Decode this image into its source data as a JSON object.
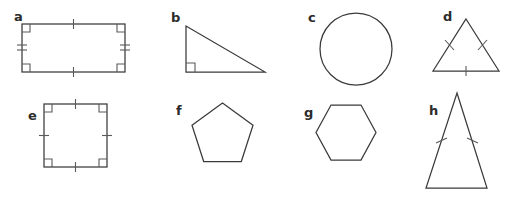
{
  "figure": {
    "background_color": "#ffffff",
    "stroke_color": "#3a3a3a",
    "mark_color": "#5a5a5a",
    "width": 513,
    "height": 205
  },
  "shapes": [
    {
      "label": "a",
      "name": "rectangle",
      "row": 1,
      "column": 1,
      "side_marks": "one tick on top and bottom, two ticks on left and right",
      "angle_marks": "right angle square at all four corners"
    },
    {
      "label": "b",
      "name": "right-triangle",
      "row": 1,
      "column": 2,
      "side_marks": "none",
      "angle_marks": "right angle square at bottom left vertex"
    },
    {
      "label": "c",
      "name": "circle",
      "row": 1,
      "column": 3,
      "side_marks": "none",
      "angle_marks": "none"
    },
    {
      "label": "d",
      "name": "isosceles-triangle",
      "row": 1,
      "column": 4,
      "side_marks": "one tick on each slanted side and one tick on the base",
      "angle_marks": "none"
    },
    {
      "label": "e",
      "name": "square",
      "row": 2,
      "column": 1,
      "side_marks": "one tick on all four sides",
      "angle_marks": "right angle square at all four corners"
    },
    {
      "label": "f",
      "name": "pentagon",
      "row": 2,
      "column": 2,
      "side_marks": "none",
      "angle_marks": "none"
    },
    {
      "label": "g",
      "name": "hexagon",
      "row": 2,
      "column": 3,
      "side_marks": "none",
      "angle_marks": "none"
    },
    {
      "label": "h",
      "name": "tall-isosceles-triangle",
      "row": 2,
      "column": 4,
      "side_marks": "one tick on each slanted side",
      "angle_marks": "none"
    }
  ]
}
